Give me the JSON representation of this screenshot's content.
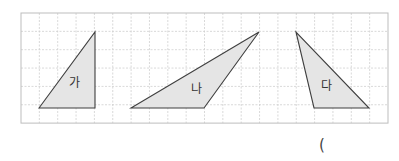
{
  "grid": {
    "origin_x": 21,
    "origin_y": 13,
    "cell": 18.35,
    "cols": 20,
    "rows": 6,
    "line_color": "#cfcfcf",
    "border_color": "#bdbdbd"
  },
  "style": {
    "fill": "#e5e5e5",
    "stroke": "#3f3f3f"
  },
  "triangles": [
    {
      "label": "가",
      "points": [
        [
          39,
          108
        ],
        [
          95,
          32
        ],
        [
          95,
          108
        ]
      ],
      "label_pos": [
        74,
        87
      ]
    },
    {
      "label": "나",
      "points": [
        [
          131,
          108
        ],
        [
          259,
          32
        ],
        [
          204,
          108
        ]
      ],
      "label_pos": [
        196,
        93
      ]
    },
    {
      "label": "다",
      "points": [
        [
          296,
          32
        ],
        [
          314,
          108
        ],
        [
          369,
          108
        ]
      ],
      "label_pos": [
        326,
        90
      ]
    }
  ],
  "answer": {
    "open_paren": "("
  }
}
